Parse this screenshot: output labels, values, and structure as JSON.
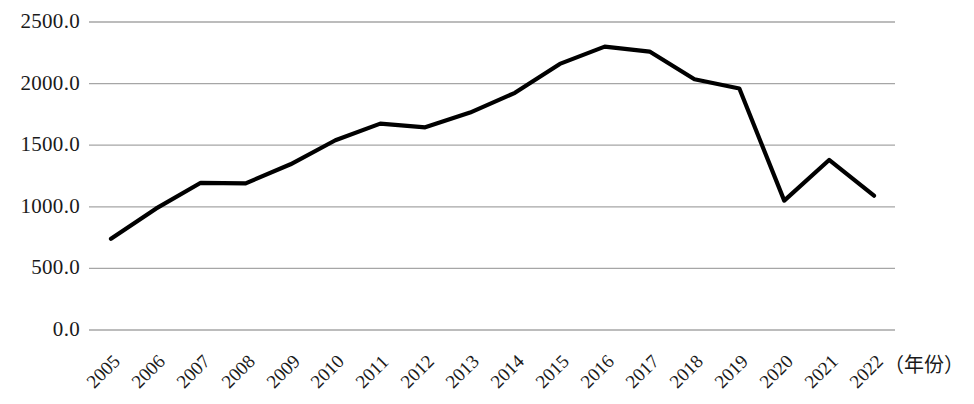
{
  "chart_data": {
    "type": "line",
    "title": "",
    "subtitle": "",
    "xlabel": "（年份）",
    "ylabel": "",
    "grid": true,
    "legend": null,
    "legend_position": "none",
    "line_color": "#000000",
    "grid_color": "#a6a6a6",
    "axis_color": "#a6a6a6",
    "background": "#ffffff",
    "categories": [
      "2005",
      "2006",
      "2007",
      "2008",
      "2009",
      "2010",
      "2011",
      "2012",
      "2013",
      "2014",
      "2015",
      "2016",
      "2017",
      "2018",
      "2019",
      "2020",
      "2021",
      "2022"
    ],
    "values": [
      740,
      985,
      1195,
      1190,
      1345,
      1540,
      1675,
      1645,
      1765,
      1925,
      2160,
      2300,
      2260,
      2035,
      1960,
      1050,
      1380,
      1090
    ],
    "series": [
      {
        "name": "",
        "values": [
          740,
          985,
          1195,
          1190,
          1345,
          1540,
          1675,
          1645,
          1765,
          1925,
          2160,
          2300,
          2260,
          2035,
          1960,
          1050,
          1380,
          1090
        ]
      }
    ],
    "ylim": [
      0,
      2500
    ],
    "ytick_labels": [
      "2500.0",
      "2000.0",
      "1500.0",
      "1000.0",
      "500.0",
      "0.0"
    ],
    "ytick_values": [
      2500,
      2000,
      1500,
      1000,
      500,
      0
    ],
    "xtick_labels": [
      "2005",
      "2006",
      "2007",
      "2008",
      "2009",
      "2010",
      "2011",
      "2012",
      "2013",
      "2014",
      "2015",
      "2016",
      "2017",
      "2018",
      "2019",
      "2020",
      "2021",
      "2022"
    ]
  }
}
